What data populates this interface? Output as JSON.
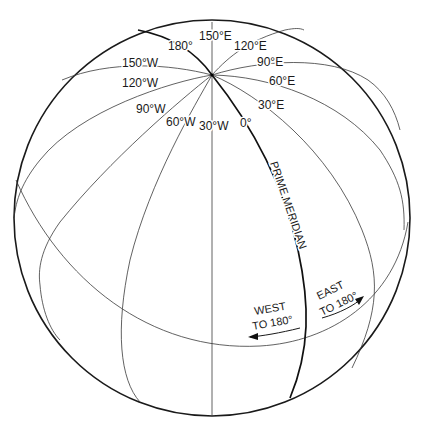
{
  "diagram": {
    "colors": {
      "background": "#ffffff",
      "line": "#1a1a1a"
    },
    "meridian_labels": {
      "m180": "180°",
      "m150e": "150°E",
      "m120e": "120°E",
      "m90e": "90°E",
      "m60e": "60°E",
      "m30e": "30°E",
      "m0": "0°",
      "m30w": "30°W",
      "m60w": "60°W",
      "m90w": "90°W",
      "m120w": "120°W",
      "m150w": "150°W"
    },
    "prime_meridian_label": "PRIME MERIDIAN",
    "east_label_line1": "EAST",
    "east_label_line2": "TO 180°",
    "west_label_line1": "WEST",
    "west_label_line2": "TO 180°"
  }
}
